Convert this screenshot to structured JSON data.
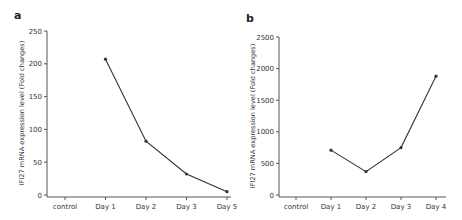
{
  "chart_data": [
    {
      "type": "line",
      "panel": "a",
      "title": "",
      "xlabel": "",
      "ylabel": "IFI27 mRNA expression level (Fold changes)",
      "categories": [
        "control",
        "Day 1",
        "Day 2",
        "Day 3",
        "Day 5"
      ],
      "series": [
        {
          "name": "IFI27",
          "values": [
            null,
            207,
            82,
            32,
            5
          ]
        }
      ],
      "ylim": [
        0,
        250
      ],
      "yticks": [
        0,
        50,
        100,
        150,
        200,
        250
      ],
      "grid": false,
      "legend": "none",
      "color": "#333333"
    },
    {
      "type": "line",
      "panel": "b",
      "title": "",
      "xlabel": "",
      "ylabel": "IFI27 mRNA expression level (Fold changes)",
      "categories": [
        "control",
        "Day 1",
        "Day 2",
        "Day 3",
        "Day 4"
      ],
      "series": [
        {
          "name": "IFI27",
          "values": [
            null,
            710,
            370,
            750,
            1880
          ]
        }
      ],
      "ylim": [
        0,
        2500
      ],
      "yticks": [
        0,
        500,
        1000,
        1500,
        2000,
        2500
      ],
      "grid": false,
      "legend": "none",
      "color": "#333333"
    }
  ]
}
